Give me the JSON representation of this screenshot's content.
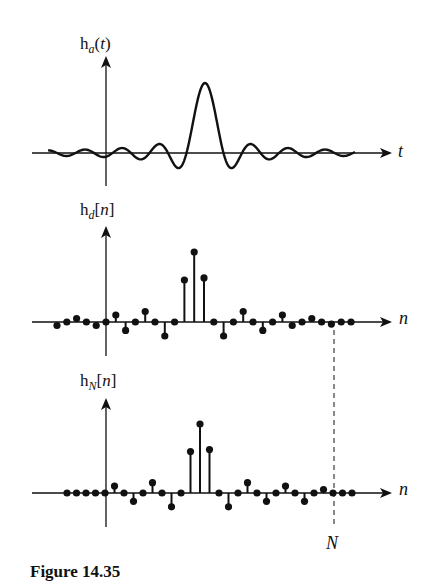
{
  "figure": {
    "caption": "Figure 14.35",
    "panels": [
      {
        "id": "analog",
        "ylabel_base": "h",
        "ylabel_sub": "a",
        "ylabel_open": "(",
        "ylabel_arg": "t",
        "ylabel_close": ")",
        "xlabel": "t"
      },
      {
        "id": "discrete",
        "ylabel_base": "h",
        "ylabel_sub": "d",
        "ylabel_open": "[",
        "ylabel_arg": "n",
        "ylabel_close": "]",
        "xlabel": "n"
      },
      {
        "id": "truncated",
        "ylabel_base": "h",
        "ylabel_sub": "N",
        "ylabel_open": "[",
        "ylabel_arg": "n",
        "ylabel_close": "]",
        "xlabel": "n"
      }
    ],
    "marker_label": "N"
  },
  "chart_data": [
    {
      "type": "line",
      "title": "h_a(t)",
      "xlabel": "t",
      "ylabel": "h_a(t)",
      "description": "Continuous sinc-shaped impulse response centered right of origin with decaying side lobes",
      "center_offset": 10,
      "grid": false
    },
    {
      "type": "stem",
      "title": "h_d[n]",
      "xlabel": "n",
      "ylabel": "h_d[n]",
      "x": [
        -5,
        -4,
        -3,
        -2,
        -1,
        0,
        1,
        2,
        3,
        4,
        5,
        6,
        7,
        8,
        9,
        10,
        11,
        12,
        13,
        14,
        15,
        16,
        17,
        18,
        19,
        20,
        21,
        22,
        23,
        24,
        25
      ],
      "values": [
        -0.05,
        0,
        0.05,
        0,
        -0.05,
        0,
        0.1,
        -0.12,
        0,
        0.15,
        0,
        -0.2,
        0,
        0.6,
        1.0,
        0.63,
        0,
        -0.2,
        0,
        0.15,
        0,
        -0.12,
        0,
        0.1,
        -0.05,
        0,
        0.05,
        0,
        -0.03,
        0,
        0
      ],
      "grid": false
    },
    {
      "type": "stem",
      "title": "h_N[n]",
      "xlabel": "n",
      "ylabel": "h_N[n]",
      "x": [
        -4,
        -3,
        -2,
        -1,
        0,
        1,
        2,
        3,
        4,
        5,
        6,
        7,
        8,
        9,
        10,
        11,
        12,
        13,
        14,
        15,
        16,
        17,
        18,
        19,
        20,
        21,
        22,
        23,
        24,
        25,
        26
      ],
      "values": [
        0,
        0,
        0,
        0,
        0,
        0.1,
        0,
        -0.12,
        0,
        0.15,
        0,
        -0.2,
        0,
        0.6,
        1.0,
        0.63,
        0,
        -0.2,
        0,
        0.15,
        0,
        -0.12,
        0,
        0.1,
        0,
        -0.12,
        0,
        0.05,
        0,
        0,
        0
      ],
      "annotation": "N (truncation point, dashed line)",
      "grid": false
    }
  ]
}
